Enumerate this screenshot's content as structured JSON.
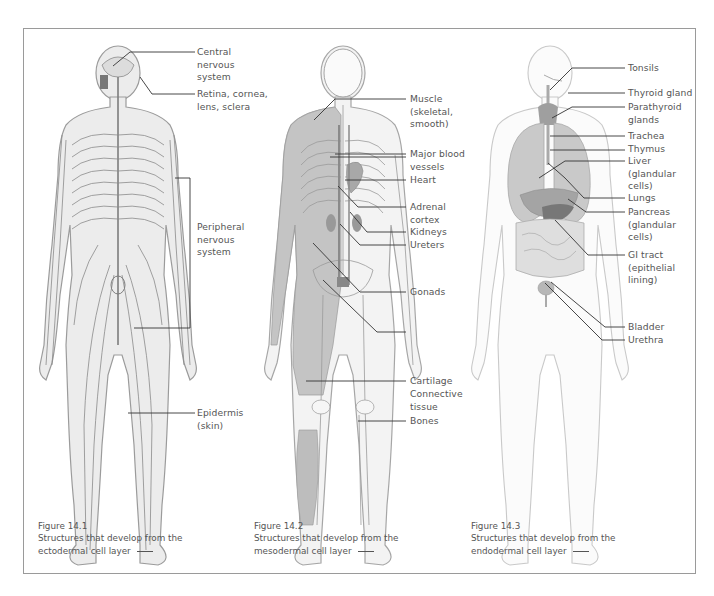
{
  "figures": [
    {
      "id": "14.1",
      "caption_title": "Figure 14.1",
      "caption_line1": "Structures that develop from the",
      "caption_line2": "ectodermal cell layer",
      "labels": [
        "Central\nnervous\nsystem",
        "Retina, cornea,\nlens, sclera",
        "Peripheral\nnervous\nsystem",
        "Epidermis\n(skin)"
      ]
    },
    {
      "id": "14.2",
      "caption_title": "Figure 14.2",
      "caption_line1": "Structures that develop from the",
      "caption_line2": "mesodermal cell layer",
      "labels": [
        "Muscle\n(skeletal,\nsmooth)",
        "Major blood\nvessels",
        "Heart",
        "Adrenal\ncortex",
        "Kidneys",
        "Ureters",
        "Gonads",
        "Cartilage",
        "Connective\ntissue",
        "Bones"
      ]
    },
    {
      "id": "14.3",
      "caption_title": "Figure 14.3",
      "caption_line1": "Structures that develop from the",
      "caption_line2": "endodermal cell layer",
      "labels": [
        "Tonsils",
        "Thyroid gland",
        "Parathyroid\nglands",
        "Trachea",
        "Thymus",
        "Liver\n(glandular\ncells)",
        "Lungs",
        "Pancreas\n(glandular\ncells)",
        "GI tract\n(epithelial\nlining)",
        "Bladder",
        "Urethra"
      ]
    }
  ],
  "colors": {
    "frame": "#9a9a9a",
    "body_fill": "#ececec",
    "outline": "#9b9b9b",
    "nerve": "#8a8a8a",
    "muscle": "#c4c4c4",
    "organ_dark": "#8c8c8c",
    "organ_mid": "#b5b5b5",
    "leader": "#333333"
  }
}
